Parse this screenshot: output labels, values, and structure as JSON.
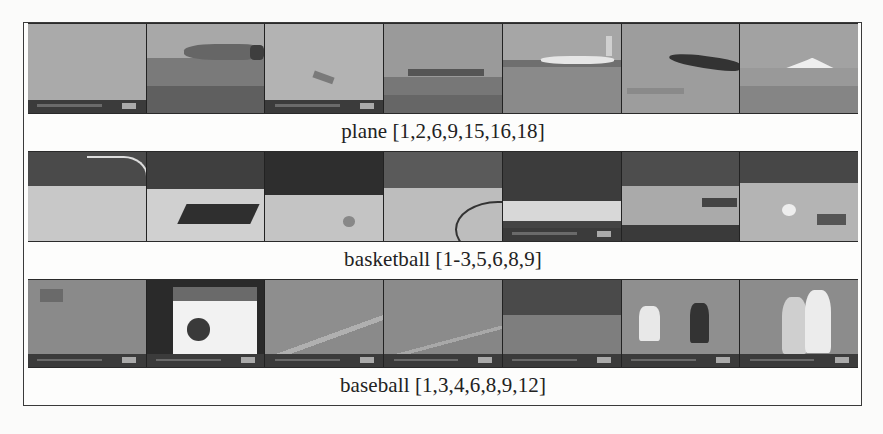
{
  "figure": {
    "rows": [
      {
        "id": "plane",
        "caption": "plane [1,2,6,9,15,16,18]",
        "frames": [
          {
            "index": 1,
            "scene": "overcast-sky",
            "sky": "#a9a9a9",
            "ground": "#a0a0a0",
            "overlay_bar": true
          },
          {
            "index": 2,
            "scene": "plane-close",
            "sky": "#a6a6a6",
            "ground": "#6f6f6f",
            "overlay_bar": false
          },
          {
            "index": 3,
            "scene": "plane-far-sky",
            "sky": "#b4b4b4",
            "ground": "#b0b0b0",
            "overlay_bar": true
          },
          {
            "index": 4,
            "scene": "plane-takeoff",
            "sky": "#9b9b9b",
            "ground": "#7d7d7d",
            "overlay_bar": false
          },
          {
            "index": 5,
            "scene": "airliner-runway",
            "sky": "#a7a7a7",
            "ground": "#8a8a8a",
            "overlay_bar": false
          },
          {
            "index": 6,
            "scene": "plane-landing",
            "sky": "#9e9e9e",
            "ground": "#979797",
            "overlay_bar": false
          },
          {
            "index": 7,
            "scene": "concorde",
            "sky": "#a2a2a2",
            "ground": "#8a8a8a",
            "overlay_bar": false
          }
        ]
      },
      {
        "id": "basketball",
        "caption": "basketball [1-3,5,6,8,9]",
        "frames": [
          {
            "index": 1,
            "scene": "court-hoop",
            "crowd": "#4a4a4a",
            "floor": "#c8c8c8",
            "overlay_bar": false
          },
          {
            "index": 2,
            "scene": "court-paint",
            "crowd": "#3f3f3f",
            "floor": "#d0d0d0",
            "overlay_bar": false
          },
          {
            "index": 3,
            "scene": "court-wide",
            "crowd": "#333333",
            "floor": "#c4c4c4",
            "overlay_bar": false
          },
          {
            "index": 4,
            "scene": "court-players",
            "crowd": "#5a5a5a",
            "floor": "#bdbdbd",
            "overlay_bar": false
          },
          {
            "index": 5,
            "scene": "court-sideline",
            "crowd": "#3c3c3c",
            "floor": "#b8b8b8",
            "overlay_bar": true
          },
          {
            "index": 6,
            "scene": "court-overhead",
            "crowd": "#4d4d4d",
            "floor": "#aaaaaa",
            "overlay_bar": false
          },
          {
            "index": 7,
            "scene": "court-broadcast",
            "crowd": "#474747",
            "floor": "#b4b4b4",
            "overlay_bar": false
          }
        ]
      },
      {
        "id": "baseball",
        "caption": "baseball [1,3,4,6,8,9,12]",
        "frames": [
          {
            "index": 1,
            "scene": "outfield",
            "field": "#8a8a8a",
            "overlay_bar": true
          },
          {
            "index": 2,
            "scene": "web-page",
            "field": "#f0f0f0",
            "overlay_bar": true
          },
          {
            "index": 3,
            "scene": "infield-line",
            "field": "#8e8e8e",
            "overlay_bar": true
          },
          {
            "index": 4,
            "scene": "infield-line-2",
            "field": "#8b8b8b",
            "overlay_bar": true
          },
          {
            "index": 5,
            "scene": "dugout-view",
            "field": "#7e7e7e",
            "overlay_bar": true
          },
          {
            "index": 6,
            "scene": "batter-catcher",
            "field": "#8f8f8f",
            "overlay_bar": true
          },
          {
            "index": 7,
            "scene": "players-celebrate",
            "field": "#8c8c8c",
            "overlay_bar": true
          }
        ]
      }
    ]
  }
}
